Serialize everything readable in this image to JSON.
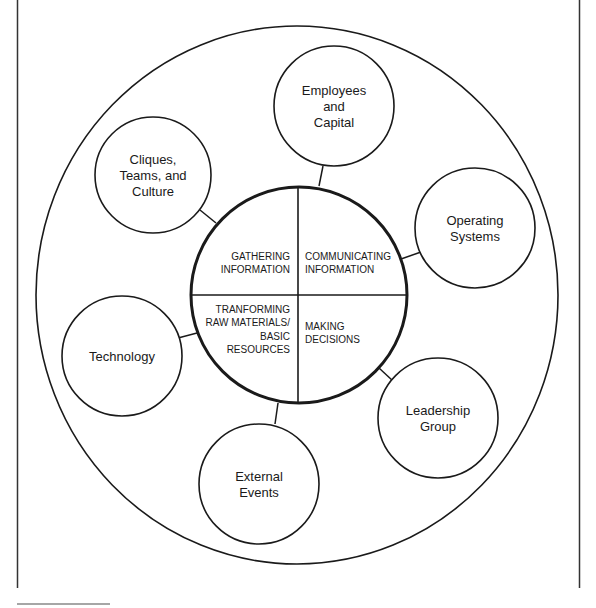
{
  "diagram": {
    "colors": {
      "stroke": "#1a1a1a",
      "background": "#ffffff",
      "rule": "#888888"
    },
    "core": {
      "quadrants": [
        {
          "id": "top-left",
          "lines": [
            "GATHERING",
            "INFORMATION"
          ]
        },
        {
          "id": "top-right",
          "lines": [
            "COMMUNICATING",
            "INFORMATION"
          ]
        },
        {
          "id": "bottom-left",
          "lines": [
            "TRANFORMING",
            "RAW MATERIALS/",
            "BASIC",
            "RESOURCES"
          ]
        },
        {
          "id": "bottom-right",
          "lines": [
            "MAKING",
            "DECISIONS"
          ]
        }
      ]
    },
    "satellites": [
      {
        "id": "employees",
        "lines": [
          "Employees",
          "and",
          "Capital"
        ]
      },
      {
        "id": "operating",
        "lines": [
          "Operating",
          "Systems"
        ]
      },
      {
        "id": "leadership",
        "lines": [
          "Leadership",
          "Group"
        ]
      },
      {
        "id": "external",
        "lines": [
          "External",
          "Events"
        ]
      },
      {
        "id": "technology",
        "lines": [
          "Technology"
        ]
      },
      {
        "id": "cliques",
        "lines": [
          "Cliques,",
          "Teams, and",
          "Culture"
        ]
      }
    ]
  }
}
